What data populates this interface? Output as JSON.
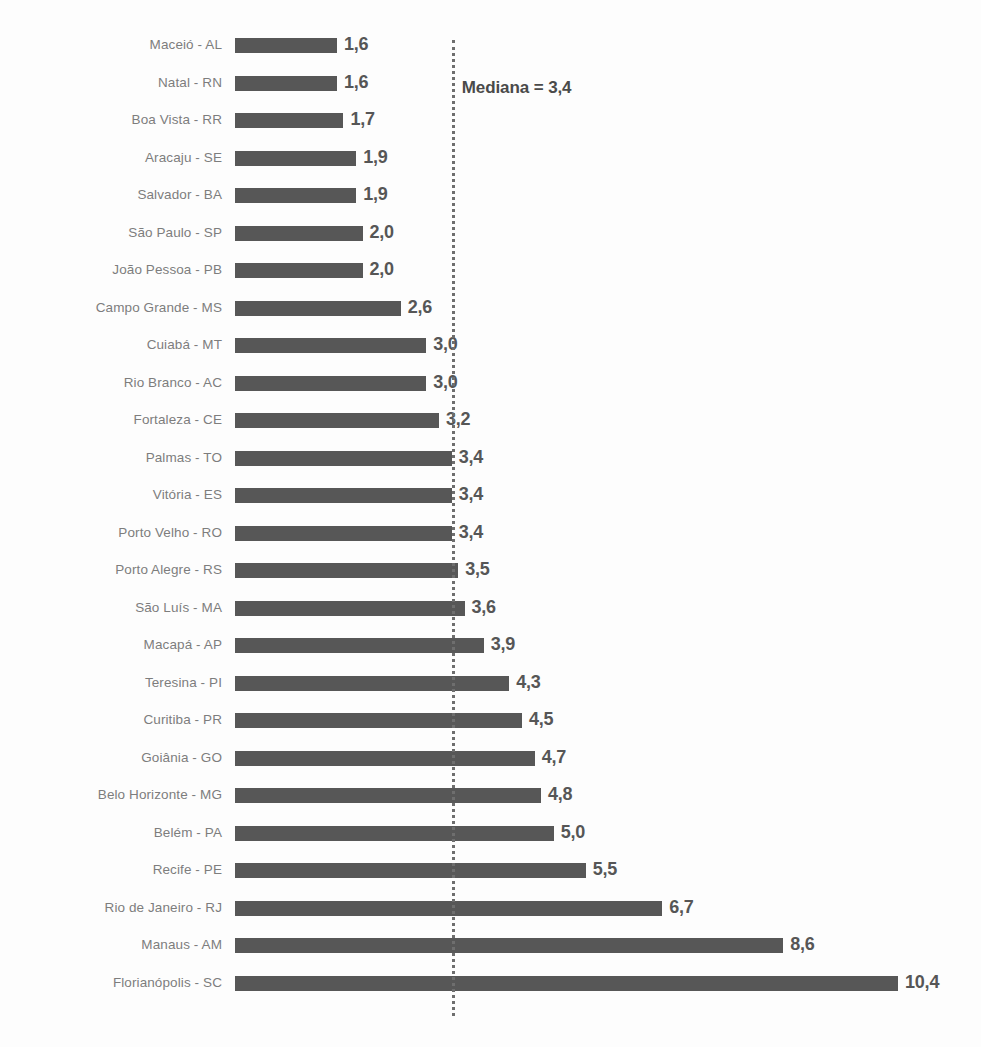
{
  "chart_data": {
    "type": "bar",
    "orientation": "horizontal",
    "title": "",
    "subtitle": "",
    "xlabel": "",
    "ylabel": "",
    "grid": false,
    "legend": null,
    "xlim": [
      0,
      10.4
    ],
    "value_format": "comma-decimal",
    "categories": [
      "Maceió - AL",
      "Natal - RN",
      "Boa Vista - RR",
      "Aracaju - SE",
      "Salvador - BA",
      "São Paulo - SP",
      "João Pessoa - PB",
      "Campo Grande - MS",
      "Cuiabá - MT",
      "Rio Branco - AC",
      "Fortaleza - CE",
      "Palmas - TO",
      "Vitória - ES",
      "Porto Velho - RO",
      "Porto Alegre - RS",
      "São Luís - MA",
      "Macapá - AP",
      "Teresina - PI",
      "Curitiba - PR",
      "Goiânia - GO",
      "Belo Horizonte - MG",
      "Belém - PA",
      "Recife - PE",
      "Rio de Janeiro - RJ",
      "Manaus - AM",
      "Florianópolis - SC"
    ],
    "values": [
      1.6,
      1.6,
      1.7,
      1.9,
      1.9,
      2.0,
      2.0,
      2.6,
      3.0,
      3.0,
      3.2,
      3.4,
      3.4,
      3.4,
      3.5,
      3.6,
      3.9,
      4.3,
      4.5,
      4.7,
      4.8,
      5.0,
      5.5,
      6.7,
      8.6,
      10.4
    ],
    "value_labels": [
      "1,6",
      "1,6",
      "1,7",
      "1,9",
      "1,9",
      "2,0",
      "2,0",
      "2,6",
      "3,0",
      "3,0",
      "3,2",
      "3,4",
      "3,4",
      "3,4",
      "3,5",
      "3,6",
      "3,9",
      "4,3",
      "4,5",
      "4,7",
      "4,8",
      "5,0",
      "5,5",
      "6,7",
      "8,6",
      "10,4"
    ],
    "annotations": [
      {
        "name": "median-reference-line",
        "label": "Mediana = 3,4",
        "value": 3.4,
        "style": "dotted-vertical"
      }
    ],
    "colors": {
      "bar": "#575757",
      "category_label": "#7d7d7d",
      "value_label": "#565656",
      "median_line": "#6e6e6e",
      "median_label": "#4a4a4a",
      "background": "#fdfdfd"
    }
  }
}
